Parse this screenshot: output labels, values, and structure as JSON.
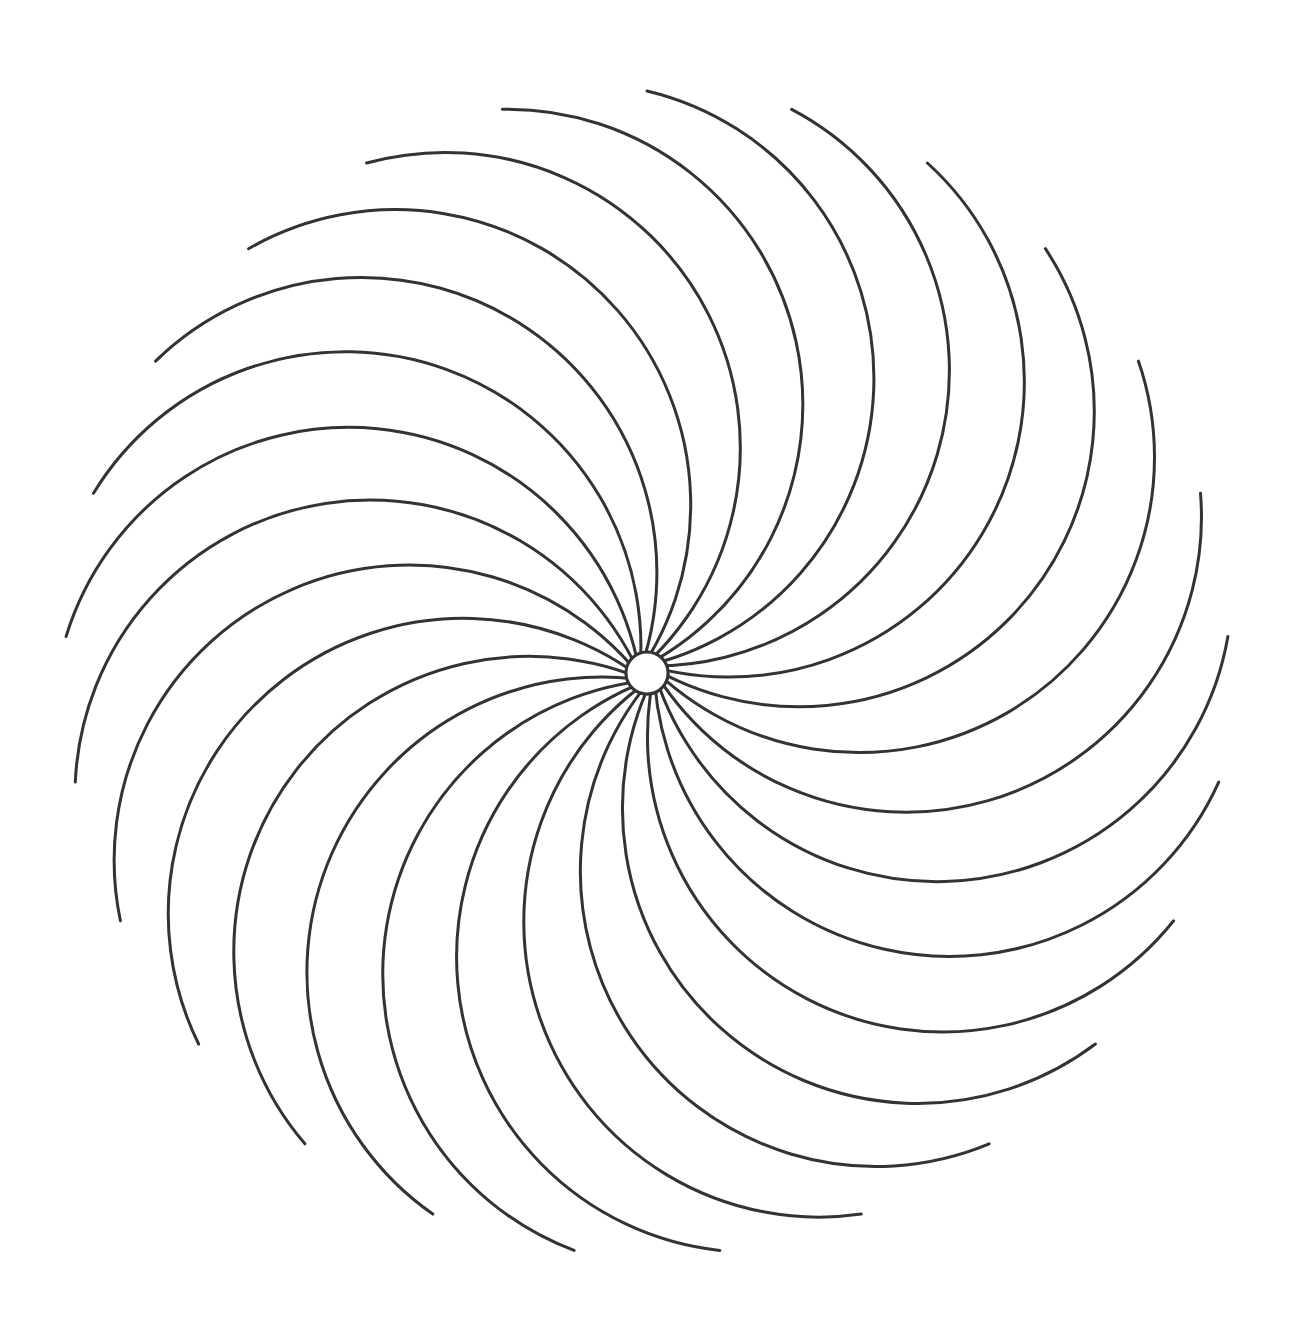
{
  "figure": {
    "background": "#ffffff",
    "stroke_color": "#333333",
    "stroke_width": 3,
    "center": [
      647,
      673
    ],
    "hub_radius": 21,
    "arc_count": 25,
    "tip_radius": 582,
    "first_tip_angle_deg": -90,
    "bulge_factor": 1.02,
    "rotation": "counter-clockwise"
  }
}
